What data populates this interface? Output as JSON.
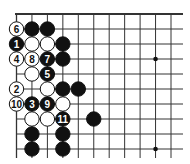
{
  "diagram": {
    "grid": {
      "origin_x": 16.5,
      "origin_y": 14,
      "spacing_x": 15.45,
      "spacing_y": 15,
      "columns": 12,
      "rows": 10,
      "line_color": "#333333",
      "top_edge": true,
      "left_edge": true
    },
    "star_points": [
      {
        "col": 9,
        "row": 3
      },
      {
        "col": 9,
        "row": 9
      }
    ],
    "stones": [
      {
        "col": 0,
        "row": 1,
        "color": "white",
        "label": "6"
      },
      {
        "col": 1,
        "row": 1,
        "color": "black",
        "label": ""
      },
      {
        "col": 2,
        "row": 1,
        "color": "black",
        "label": ""
      },
      {
        "col": 0,
        "row": 2,
        "color": "black",
        "label": "1"
      },
      {
        "col": 1,
        "row": 2,
        "color": "white",
        "label": ""
      },
      {
        "col": 2,
        "row": 2,
        "color": "white",
        "label": ""
      },
      {
        "col": 3,
        "row": 2,
        "color": "black",
        "label": ""
      },
      {
        "col": 0,
        "row": 3,
        "color": "white",
        "label": "4"
      },
      {
        "col": 1,
        "row": 3,
        "color": "white",
        "label": "8"
      },
      {
        "col": 2,
        "row": 3,
        "color": "black",
        "label": "7"
      },
      {
        "col": 3,
        "row": 3,
        "color": "black",
        "label": ""
      },
      {
        "col": 1,
        "row": 4,
        "color": "white",
        "label": ""
      },
      {
        "col": 2,
        "row": 4,
        "color": "black",
        "label": "5"
      },
      {
        "col": 0,
        "row": 5,
        "color": "white",
        "label": "2"
      },
      {
        "col": 2,
        "row": 5,
        "color": "white",
        "label": ""
      },
      {
        "col": 3,
        "row": 5,
        "color": "black",
        "label": ""
      },
      {
        "col": 4,
        "row": 5,
        "color": "black",
        "label": ""
      },
      {
        "col": 0,
        "row": 6,
        "color": "white",
        "label": "10"
      },
      {
        "col": 1,
        "row": 6,
        "color": "black",
        "label": "3"
      },
      {
        "col": 2,
        "row": 6,
        "color": "black",
        "label": "9"
      },
      {
        "col": 3,
        "row": 6,
        "color": "white",
        "label": ""
      },
      {
        "col": 1,
        "row": 7,
        "color": "white",
        "label": ""
      },
      {
        "col": 2,
        "row": 7,
        "color": "white",
        "label": ""
      },
      {
        "col": 3,
        "row": 7,
        "color": "black",
        "label": "11"
      },
      {
        "col": 5,
        "row": 7,
        "color": "black",
        "label": ""
      },
      {
        "col": 1,
        "row": 8,
        "color": "black",
        "label": ""
      },
      {
        "col": 3,
        "row": 8,
        "color": "black",
        "label": ""
      },
      {
        "col": 1,
        "row": 9,
        "color": "black",
        "label": ""
      },
      {
        "col": 3,
        "row": 9,
        "color": "black",
        "label": ""
      }
    ],
    "colors": {
      "black_stone": "#111111",
      "white_stone": "#ffffff",
      "stone_outline": "#111111",
      "label_on_black": "#ffffff",
      "label_on_white": "#111111"
    }
  }
}
